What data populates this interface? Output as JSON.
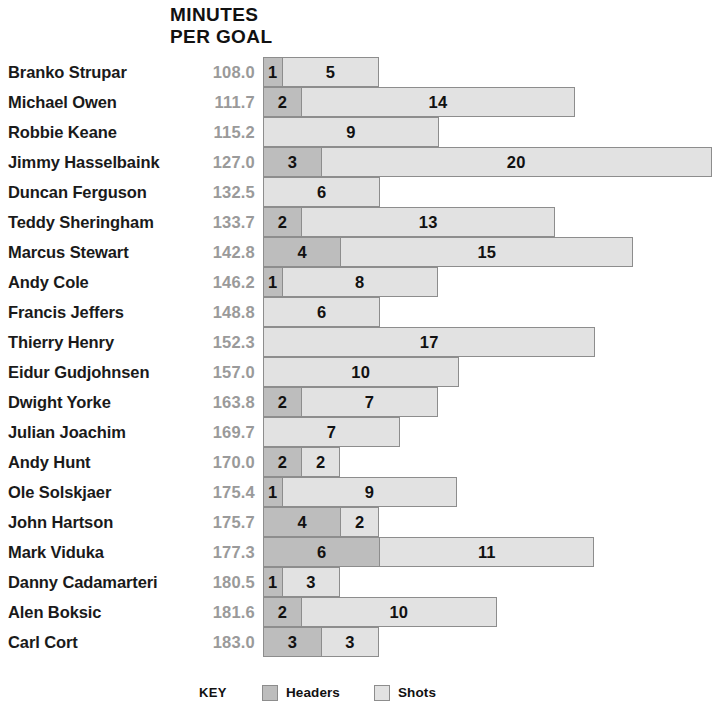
{
  "chart_data": {
    "type": "bar",
    "title": "MINUTES PER GOAL",
    "title_lines": [
      "MINUTES",
      "PER GOAL"
    ],
    "orientation": "horizontal",
    "stacked": true,
    "xlabel": "",
    "ylabel": "",
    "grid": false,
    "legend_position": "bottom",
    "legend_title": "KEY",
    "colors": {
      "headers": "#bdbdbd",
      "shots": "#e2e2e2",
      "border": "#8d8d8d",
      "minutes_text": "#9a9a9a",
      "name_text": "#1a1a1a"
    },
    "categories": [
      "Branko Strupar",
      "Michael Owen",
      "Robbie Keane",
      "Jimmy Hasselbaink",
      "Duncan Ferguson",
      "Teddy Sheringham",
      "Marcus Stewart",
      "Andy Cole",
      "Francis Jeffers",
      "Thierry Henry",
      "Eidur Gudjohnsen",
      "Dwight Yorke",
      "Julian Joachim",
      "Andy Hunt",
      "Ole Solskjaer",
      "John Hartson",
      "Mark Viduka",
      "Danny Cadamarteri",
      "Alen Boksic",
      "Carl Cort"
    ],
    "minutes_per_goal": [
      "108.0",
      "111.7",
      "115.2",
      "127.0",
      "132.5",
      "133.7",
      "142.8",
      "146.2",
      "148.8",
      "152.3",
      "157.0",
      "163.8",
      "169.7",
      "170.0",
      "175.4",
      "175.7",
      "177.3",
      "180.5",
      "181.6",
      "183.0"
    ],
    "series": [
      {
        "name": "Headers",
        "color": "#bdbdbd",
        "values": [
          1,
          2,
          0,
          3,
          0,
          2,
          4,
          1,
          0,
          0,
          0,
          2,
          0,
          2,
          1,
          4,
          6,
          1,
          2,
          3
        ]
      },
      {
        "name": "Shots",
        "color": "#e2e2e2",
        "values": [
          5,
          14,
          9,
          20,
          6,
          13,
          15,
          8,
          6,
          17,
          10,
          7,
          7,
          2,
          9,
          2,
          11,
          3,
          10,
          3
        ]
      }
    ],
    "unit_px": 19.55,
    "bar_origin_px": 263
  },
  "legend": {
    "key_label": "KEY",
    "items": [
      {
        "label": "Headers",
        "swatch": "headers"
      },
      {
        "label": "Shots",
        "swatch": "shots"
      }
    ]
  }
}
